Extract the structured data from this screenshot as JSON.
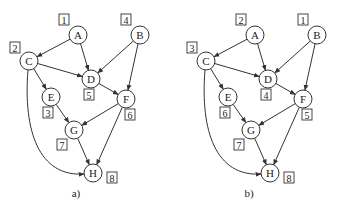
{
  "diagram": {
    "type": "directed-graph-comparison",
    "edges": [
      [
        "A",
        "C"
      ],
      [
        "A",
        "D"
      ],
      [
        "B",
        "D"
      ],
      [
        "B",
        "F"
      ],
      [
        "C",
        "D"
      ],
      [
        "C",
        "E"
      ],
      [
        "C",
        "H"
      ],
      [
        "D",
        "F"
      ],
      [
        "E",
        "G"
      ],
      [
        "F",
        "G"
      ],
      [
        "F",
        "H"
      ],
      [
        "G",
        "H"
      ]
    ],
    "panels": [
      {
        "caption": "a)",
        "nodes": [
          {
            "id": "A",
            "label": "A",
            "order": "1"
          },
          {
            "id": "B",
            "label": "B",
            "order": "4"
          },
          {
            "id": "C",
            "label": "C",
            "order": "2"
          },
          {
            "id": "D",
            "label": "D",
            "order": "5"
          },
          {
            "id": "E",
            "label": "E",
            "order": "3"
          },
          {
            "id": "F",
            "label": "F",
            "order": "6"
          },
          {
            "id": "G",
            "label": "G",
            "order": "7"
          },
          {
            "id": "H",
            "label": "H",
            "order": "8"
          }
        ]
      },
      {
        "caption": "b)",
        "nodes": [
          {
            "id": "A",
            "label": "A",
            "order": "2"
          },
          {
            "id": "B",
            "label": "B",
            "order": "1"
          },
          {
            "id": "C",
            "label": "C",
            "order": "3"
          },
          {
            "id": "D",
            "label": "D",
            "order": "4"
          },
          {
            "id": "E",
            "label": "E",
            "order": "6"
          },
          {
            "id": "F",
            "label": "F",
            "order": "5"
          },
          {
            "id": "G",
            "label": "G",
            "order": "7"
          },
          {
            "id": "H",
            "label": "H",
            "order": "8"
          }
        ]
      }
    ]
  },
  "colors": {
    "stroke": "#333333",
    "background": "#ffffff"
  }
}
